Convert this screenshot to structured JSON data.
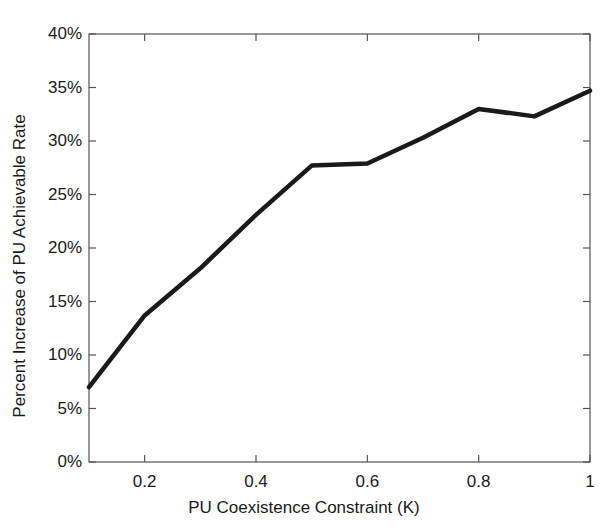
{
  "chart_data": {
    "type": "line",
    "title": "",
    "xlabel": "PU Coexistence Constraint (K)",
    "ylabel": "Percent Increase of PU Achievable Rate",
    "x": [
      0.1,
      0.2,
      0.3,
      0.4,
      0.5,
      0.6,
      0.7,
      0.8,
      0.9,
      1.0
    ],
    "values": [
      7.0,
      13.7,
      18.1,
      23.1,
      27.7,
      27.9,
      30.3,
      33.0,
      32.3,
      34.7
    ],
    "series": [
      {
        "name": "Percent Increase of PU Achievable Rate",
        "values": [
          7.0,
          13.7,
          18.1,
          23.1,
          27.7,
          27.9,
          30.3,
          33.0,
          32.3,
          34.7
        ]
      }
    ],
    "xlim": [
      0.1,
      1.0
    ],
    "ylim": [
      0,
      40
    ],
    "xtick_values": [
      0.2,
      0.4,
      0.6,
      0.8,
      1.0
    ],
    "xtick_labels": [
      "0.2",
      "0.4",
      "0.6",
      "0.8",
      "1"
    ],
    "ytick_values": [
      0,
      5,
      10,
      15,
      20,
      25,
      30,
      35,
      40
    ],
    "ytick_labels": [
      "0%",
      "5%",
      "10%",
      "15%",
      "20%",
      "25%",
      "30%",
      "35%",
      "40%"
    ],
    "grid": false,
    "legend": null,
    "line_color": "#1a1a1a",
    "line_width": 4,
    "axis_color": "#555555",
    "background": "#ffffff"
  }
}
